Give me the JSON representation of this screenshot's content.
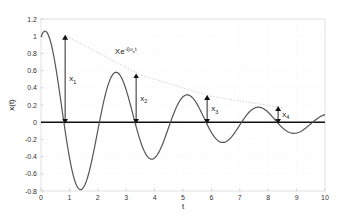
{
  "chart_data": {
    "type": "line",
    "title": "",
    "xlabel": "t",
    "ylabel": "x(t)",
    "xlim": [
      0,
      10
    ],
    "ylim": [
      -0.8,
      1.2
    ],
    "xticks": [
      0,
      1,
      2,
      3,
      4,
      5,
      6,
      7,
      8,
      9,
      10
    ],
    "yticks": [
      -0.8,
      -0.6,
      -0.4,
      -0.2,
      0,
      0.2,
      0.4,
      0.6,
      0.8,
      1,
      1.2
    ],
    "xtick_labels": [
      "0",
      "1",
      "2",
      "3",
      "4",
      "5",
      "6",
      "7",
      "8",
      "9",
      "10"
    ],
    "ytick_labels": [
      "-0.8",
      "-0.6",
      "-0.4",
      "-0.2",
      "0",
      "0.2",
      "0.4",
      "0.6",
      "0.8",
      "1",
      "1.2"
    ],
    "grid": true,
    "legend": null,
    "series": [
      {
        "name": "x(t) damped oscillation",
        "style": "solid",
        "color": "#555555",
        "model": {
          "amplitude": 1.1,
          "decay": 0.24,
          "omega_d": 2.51,
          "phase": -0.45
        },
        "key_points": [
          {
            "t": 0.0,
            "x": 1.0
          },
          {
            "t": 0.2,
            "x": 1.05
          },
          {
            "t": 0.85,
            "x": 0.0
          },
          {
            "t": 1.45,
            "x": -0.78
          },
          {
            "t": 2.1,
            "x": 0.0
          },
          {
            "t": 2.7,
            "x": 0.55
          },
          {
            "t": 3.35,
            "x": 0.0
          },
          {
            "t": 3.95,
            "x": -0.42
          },
          {
            "t": 4.6,
            "x": 0.0
          },
          {
            "t": 5.2,
            "x": 0.3
          },
          {
            "t": 5.85,
            "x": 0.0
          },
          {
            "t": 6.5,
            "x": -0.2
          },
          {
            "t": 7.1,
            "x": 0.0
          },
          {
            "t": 7.7,
            "x": 0.13
          },
          {
            "t": 8.35,
            "x": 0.0
          },
          {
            "t": 9.0,
            "x": -0.12
          },
          {
            "t": 9.6,
            "x": 0.0
          },
          {
            "t": 10.0,
            "x": 0.06
          }
        ]
      },
      {
        "name": "envelope",
        "label": "Xe^{-ζω_n t}",
        "style": "dotted",
        "color": "#cccccc",
        "points": [
          {
            "t": 0.9,
            "x": 1.0
          },
          {
            "t": 3.5,
            "x": 0.55
          },
          {
            "t": 6.0,
            "x": 0.3
          },
          {
            "t": 8.5,
            "x": 0.17
          }
        ]
      },
      {
        "name": "zero line",
        "style": "solid",
        "color": "#111111",
        "points": [
          {
            "t": 0,
            "x": 0
          },
          {
            "t": 10,
            "x": 0
          }
        ]
      }
    ],
    "annotations": [
      {
        "label": "x",
        "subscript": "1",
        "t": 0.85,
        "from": 0,
        "to": 1.0,
        "type": "double-arrow"
      },
      {
        "label": "x",
        "subscript": "2",
        "t": 3.35,
        "from": 0,
        "to": 0.55,
        "type": "double-arrow"
      },
      {
        "label": "x",
        "subscript": "3",
        "t": 5.85,
        "from": 0,
        "to": 0.3,
        "type": "double-arrow"
      },
      {
        "label": "x",
        "subscript": "4",
        "t": 8.35,
        "from": 0,
        "to": 0.17,
        "type": "double-arrow"
      },
      {
        "label": "Xe",
        "superscript": "-ζω_n t",
        "t": 2.6,
        "x": 0.86,
        "type": "text"
      }
    ]
  },
  "labels": {
    "xlabel": "t",
    "ylabel": "x(t)",
    "envelope_base": "Xe",
    "envelope_exp": "-ζω",
    "envelope_exp_sub": "n",
    "envelope_exp_tail": "t",
    "x1": "x",
    "x1_sub": "1",
    "x2": "x",
    "x2_sub": "2",
    "x3": "x",
    "x3_sub": "3",
    "x4": "x",
    "x4_sub": "4"
  }
}
